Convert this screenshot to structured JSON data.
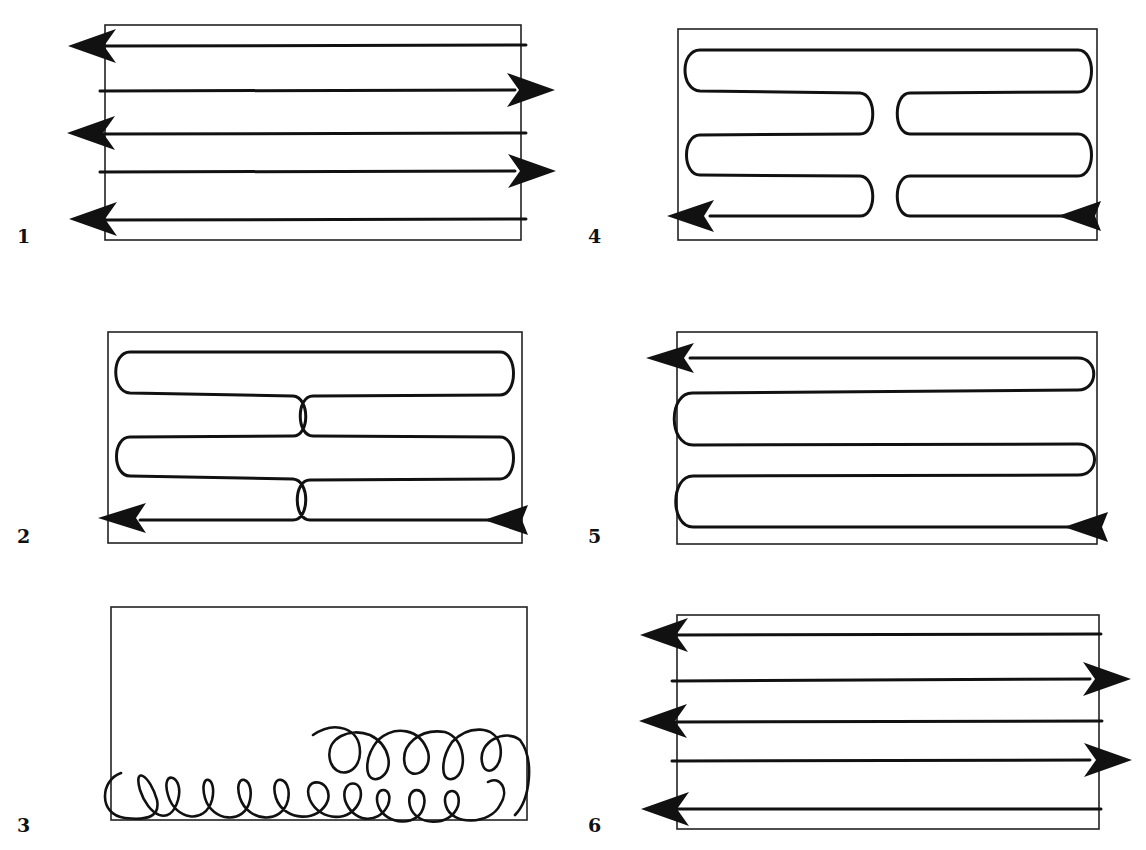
{
  "figure": {
    "panels": [
      {
        "id": 1,
        "label": "1",
        "pattern": "parallel-lines-alternating-arrows",
        "lines": 5,
        "directions": [
          "left",
          "right",
          "left",
          "right",
          "left"
        ]
      },
      {
        "id": 2,
        "label": "2",
        "pattern": "split-serpentine",
        "start": "bottom-right",
        "end": "bottom-left"
      },
      {
        "id": 3,
        "label": "3",
        "pattern": "overlapping-loops",
        "rows": 2
      },
      {
        "id": 4,
        "label": "4",
        "pattern": "split-serpentine",
        "start": "bottom-right",
        "end": "bottom-left"
      },
      {
        "id": 5,
        "label": "5",
        "pattern": "full-serpentine",
        "start": "bottom-right",
        "end": "top-left"
      },
      {
        "id": 6,
        "label": "6",
        "pattern": "parallel-lines-alternating-arrows",
        "lines": 5,
        "directions": [
          "left",
          "right",
          "left",
          "right",
          "left"
        ]
      }
    ]
  },
  "colors": {
    "ink": "#111111",
    "background": "#ffffff"
  }
}
